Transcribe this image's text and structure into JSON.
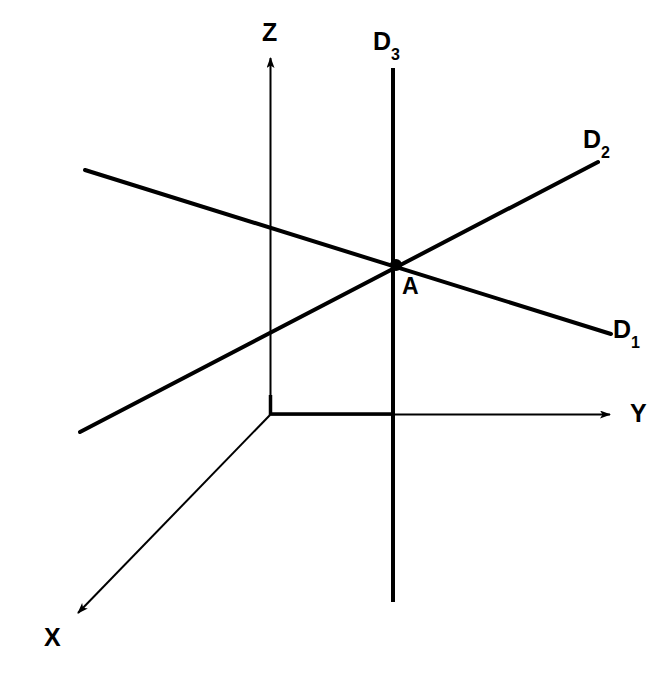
{
  "figure": {
    "type": "geometric-diagram",
    "background_color": "#ffffff",
    "stroke_color": "#000000"
  },
  "labels": {
    "z_axis": "Z",
    "y_axis": "Y",
    "x_axis": "X",
    "d1_base": "D",
    "d1_sub": "1",
    "d2_base": "D",
    "d2_sub": "2",
    "d3_base": "D",
    "d3_sub": "3",
    "point_a": "A"
  },
  "geometry": {
    "origin": {
      "x": 270,
      "y": 415
    },
    "point_a": {
      "x": 396,
      "y": 265
    },
    "axes": [
      {
        "name": "z-axis",
        "from": [
          270,
          415
        ],
        "to": [
          271,
          52
        ],
        "arrow": true,
        "stroke_width": 2
      },
      {
        "name": "y-axis",
        "from": [
          270,
          414
        ],
        "to": [
          618,
          414
        ],
        "arrow": true,
        "stroke_width": 2
      },
      {
        "name": "x-axis",
        "from": [
          270,
          415
        ],
        "to": [
          70,
          622
        ],
        "arrow": true,
        "stroke_width": 2
      }
    ],
    "lines": [
      {
        "name": "d1-line",
        "from": [
          85,
          170
        ],
        "to": [
          611,
          334
        ],
        "arrow": false,
        "stroke_width": 4
      },
      {
        "name": "d2-line",
        "from": [
          80,
          432
        ],
        "to": [
          598,
          162
        ],
        "arrow": false,
        "stroke_width": 4
      },
      {
        "name": "d3-line",
        "from": [
          393,
          68
        ],
        "to": [
          393,
          602
        ],
        "arrow": false,
        "stroke_width": 4
      }
    ],
    "markers": [
      {
        "name": "point-a-marker",
        "cx": 396,
        "cy": 265,
        "r": 6
      }
    ]
  }
}
